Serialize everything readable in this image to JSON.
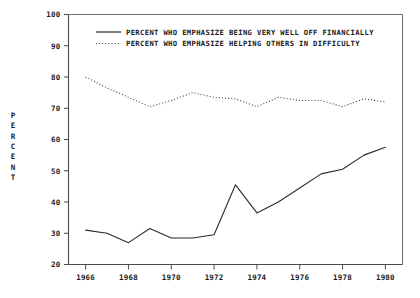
{
  "chart_data": {
    "type": "line",
    "title": "",
    "xlabel": "",
    "ylabel": "PERCENT",
    "xlim": [
      1965.2,
      1980.8
    ],
    "ylim": [
      20,
      100
    ],
    "grid": false,
    "legend_position": "top-center",
    "x": [
      1966,
      1967,
      1968,
      1969,
      1970,
      1971,
      1972,
      1973,
      1974,
      1975,
      1976,
      1977,
      1978,
      1979,
      1980
    ],
    "xticks": [
      1966,
      1968,
      1970,
      1972,
      1974,
      1976,
      1978,
      1980
    ],
    "xtick_labels": [
      "1966",
      "1968",
      "1970",
      "1972",
      "1974",
      "1976",
      "1978",
      "1980"
    ],
    "yticks": [
      20,
      30,
      40,
      50,
      60,
      70,
      80,
      90,
      100
    ],
    "ytick_labels": [
      "20",
      "30",
      "40",
      "50",
      "60",
      "70",
      "80",
      "90",
      "100"
    ],
    "series": [
      {
        "name": "PERCENT WHO EMPHASIZE BEING VERY WELL OFF FINANCIALLY",
        "style": "solid",
        "color": "#2b2b2b",
        "values": [
          31,
          30,
          27,
          31.5,
          28.5,
          28.5,
          29.5,
          45.5,
          36.5,
          40,
          44.5,
          49,
          50.5,
          55,
          57.5
        ]
      },
      {
        "name": "PERCENT WHO EMPHASIZE HELPING OTHERS IN DIFFICULTY",
        "style": "dotted",
        "color": "#3a3a3a",
        "values": [
          80,
          76.5,
          73.5,
          70.5,
          72.5,
          75,
          73.5,
          73,
          70.5,
          73.5,
          72.5,
          72.5,
          70.5,
          73,
          72
        ]
      }
    ]
  },
  "legend": {
    "entries": [
      {
        "label": "PERCENT WHO EMPHASIZE BEING VERY WELL OFF FINANCIALLY",
        "style": "solid"
      },
      {
        "label": "PERCENT WHO EMPHASIZE HELPING OTHERS IN DIFFICULTY",
        "style": "dotted"
      }
    ]
  },
  "axis": {
    "y_title": "PERCENT"
  }
}
